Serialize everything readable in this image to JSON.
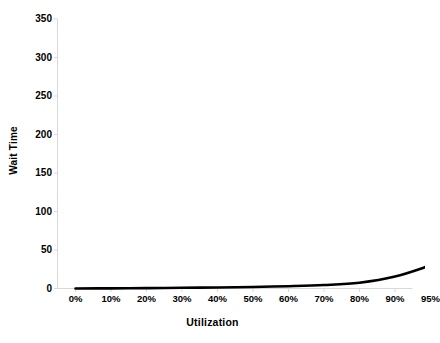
{
  "chart_data": {
    "type": "line",
    "title": "",
    "xlabel": "Utilization",
    "ylabel": "Wait Time",
    "categories": [
      "0%",
      "10%",
      "20%",
      "30%",
      "40%",
      "50%",
      "60%",
      "70%",
      "80%",
      "90%",
      "95%"
    ],
    "x_values": [
      0,
      10,
      20,
      30,
      40,
      50,
      60,
      70,
      80,
      90,
      95
    ],
    "values": [
      0,
      0.2,
      0.5,
      0.9,
      1.3,
      2.0,
      3.0,
      4.5,
      7.5,
      15.5,
      30
    ],
    "series": [
      {
        "name": "Wait Time",
        "values": [
          0,
          0.2,
          0.5,
          0.9,
          1.3,
          2.0,
          3.0,
          4.5,
          7.5,
          15.5,
          30
        ],
        "color": "#000000"
      }
    ],
    "ylim": [
      0,
      350
    ],
    "y_ticks": [
      0,
      50,
      100,
      150,
      200,
      250,
      300,
      350
    ],
    "y_tick_labels": [
      "0",
      "50",
      "100",
      "150",
      "200",
      "250",
      "300",
      "350"
    ],
    "grid": false,
    "legend": false,
    "legend_position": "none",
    "axis_color": "#d9d9d9",
    "line_color": "#000000",
    "background": "#ffffff"
  },
  "axis_title_y": "Wait Time",
  "axis_title_x": "Utilization"
}
